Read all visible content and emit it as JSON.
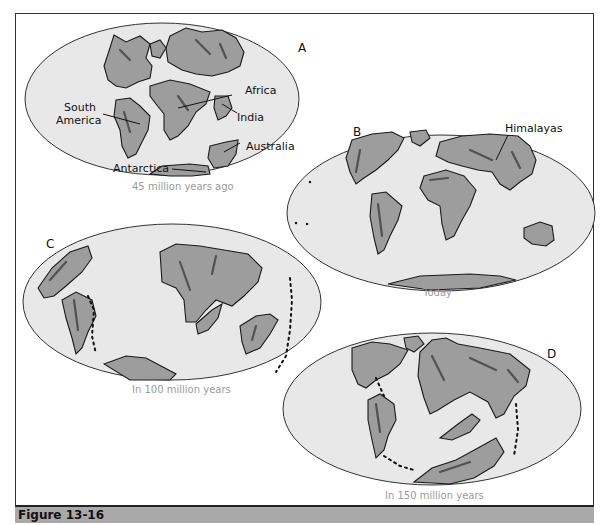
{
  "figure": {
    "caption": "Figure 13-16",
    "colors": {
      "ocean": "#e8e8e8",
      "land": "#9d9d9d",
      "outline": "#1a1a1a",
      "caption_bar": "#a9a9a9",
      "subtitle_text": "#9a9a9a"
    }
  },
  "maps": [
    {
      "id": "A",
      "letter": "A",
      "subtitle": "45 million years ago",
      "labels": [
        "South America",
        "Africa",
        "India",
        "Australia",
        "Antarctica"
      ],
      "label_lines": {
        "south_1": "South",
        "south_2": "America"
      }
    },
    {
      "id": "B",
      "letter": "B",
      "subtitle": "Today",
      "labels": [
        "Himalayas"
      ]
    },
    {
      "id": "C",
      "letter": "C",
      "subtitle": "In 100 million years"
    },
    {
      "id": "D",
      "letter": "D",
      "subtitle": "In 150 million years"
    }
  ]
}
